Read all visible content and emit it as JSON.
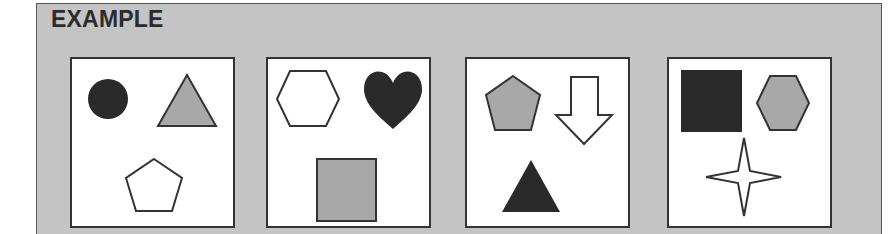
{
  "title": "EXAMPLE",
  "colors": {
    "panel": "#c4c4c4",
    "dark": "#2a2a2a",
    "gray": "#a8a8a8",
    "white": "#ffffff",
    "stroke": "#333333"
  },
  "cards": [
    {
      "index": 1,
      "shapes": [
        {
          "shape": "circle",
          "fill": "black",
          "position": "top-left"
        },
        {
          "shape": "triangle",
          "fill": "gray",
          "position": "top-right"
        },
        {
          "shape": "pentagon",
          "fill": "white",
          "position": "bottom"
        }
      ]
    },
    {
      "index": 2,
      "shapes": [
        {
          "shape": "hexagon",
          "fill": "white",
          "position": "top-left"
        },
        {
          "shape": "heart",
          "fill": "black",
          "position": "top-right"
        },
        {
          "shape": "square",
          "fill": "gray",
          "position": "bottom"
        }
      ]
    },
    {
      "index": 3,
      "shapes": [
        {
          "shape": "pentagon",
          "fill": "gray",
          "position": "top-left"
        },
        {
          "shape": "down-arrow",
          "fill": "white",
          "position": "top-right"
        },
        {
          "shape": "triangle",
          "fill": "black",
          "position": "bottom"
        }
      ]
    },
    {
      "index": 4,
      "shapes": [
        {
          "shape": "square",
          "fill": "black",
          "position": "top-left"
        },
        {
          "shape": "hexagon",
          "fill": "gray",
          "position": "top-right"
        },
        {
          "shape": "four-point-star",
          "fill": "white",
          "position": "bottom"
        }
      ]
    }
  ]
}
